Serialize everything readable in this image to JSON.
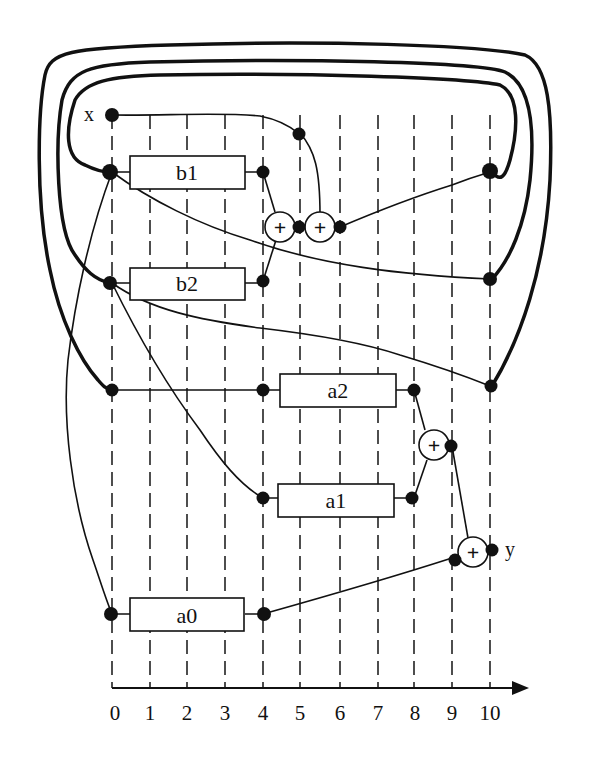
{
  "diagram": {
    "input_label": "x",
    "output_label": "y",
    "axis": {
      "ticks": [
        "0",
        "1",
        "2",
        "3",
        "4",
        "5",
        "6",
        "7",
        "8",
        "9",
        "10"
      ],
      "tick_x": [
        112,
        150,
        187,
        225,
        263,
        300,
        340,
        378,
        414,
        452,
        490
      ]
    },
    "blocks": [
      {
        "id": "b1",
        "label": "b1",
        "from_step": 0,
        "to_step": 4
      },
      {
        "id": "b2",
        "label": "b2",
        "from_step": 0,
        "to_step": 4
      },
      {
        "id": "a2",
        "label": "a2",
        "from_step": 4,
        "to_step": 8
      },
      {
        "id": "a1",
        "label": "a1",
        "from_step": 4,
        "to_step": 8
      },
      {
        "id": "a0",
        "label": "a0",
        "from_step": 0,
        "to_step": 4
      }
    ],
    "adders": [
      {
        "id": "add1",
        "label": "+",
        "step": 4.5
      },
      {
        "id": "add2",
        "label": "+",
        "step": 5.5
      },
      {
        "id": "add3",
        "label": "+",
        "step": 8.5
      },
      {
        "id": "add4",
        "label": "+",
        "step": 9.5
      }
    ],
    "feedback_loops": 3
  }
}
